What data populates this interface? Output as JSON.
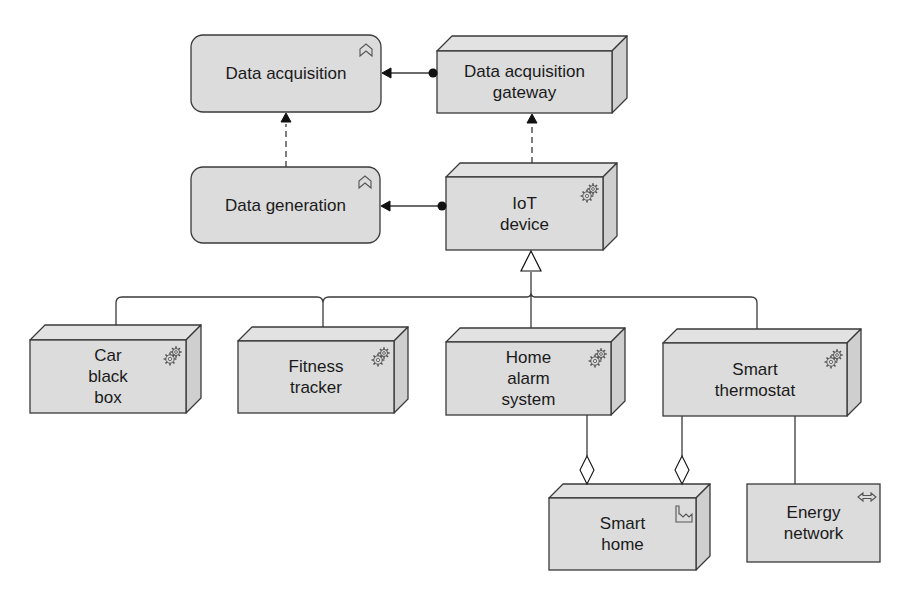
{
  "diagram": {
    "colors": {
      "fill": "#dcdcdc",
      "fill_side": "#cfcfcf",
      "fill_top": "#e2e2e2",
      "stroke": "#3a3a3a",
      "text": "#1a1a1a",
      "background": "#ffffff"
    },
    "nodes": [
      {
        "id": "data_acquisition",
        "label": "Data acquisition",
        "kind": "function",
        "icon": "function-chevron-icon",
        "x": 191,
        "y": 35,
        "w": 190,
        "h": 77
      },
      {
        "id": "data_acquisition_gateway",
        "label": "Data acquisition\ngateway",
        "kind": "node",
        "icon": "",
        "x": 437,
        "y": 51,
        "w": 175,
        "h": 62,
        "d": 15
      },
      {
        "id": "data_generation",
        "label": "Data generation",
        "kind": "function",
        "icon": "function-chevron-icon",
        "x": 191,
        "y": 167,
        "w": 189,
        "h": 76
      },
      {
        "id": "iot_device",
        "label": "IoT\ndevice",
        "kind": "node",
        "icon": "gears-icon",
        "x": 446,
        "y": 177,
        "w": 157,
        "h": 73,
        "d": 14
      },
      {
        "id": "car_black_box",
        "label": "Car\nblack\nbox",
        "kind": "node",
        "icon": "gears-icon",
        "x": 30,
        "y": 340,
        "w": 156,
        "h": 73,
        "d": 15
      },
      {
        "id": "fitness_tracker",
        "label": "Fitness\ntracker",
        "kind": "node",
        "icon": "gears-icon",
        "x": 238,
        "y": 341,
        "w": 156,
        "h": 72,
        "d": 14
      },
      {
        "id": "home_alarm_system",
        "label": "Home\nalarm\nsystem",
        "kind": "node",
        "icon": "gears-icon",
        "x": 446,
        "y": 342,
        "w": 165,
        "h": 73,
        "d": 14
      },
      {
        "id": "smart_thermostat",
        "label": "Smart\nthermostat",
        "kind": "node",
        "icon": "gears-icon",
        "x": 663,
        "y": 343,
        "w": 184,
        "h": 73,
        "d": 14
      },
      {
        "id": "smart_home",
        "label": "Smart\nhome",
        "kind": "facility",
        "icon": "factory-icon",
        "x": 549,
        "y": 498,
        "w": 147,
        "h": 72,
        "d": 14
      },
      {
        "id": "energy_network",
        "label": "Energy\nnetwork",
        "kind": "network",
        "icon": "bidirectional-arrow-icon",
        "x": 747,
        "y": 484,
        "w": 133,
        "h": 78
      }
    ],
    "relationships": [
      {
        "type": "assignment",
        "from": "data_acquisition_gateway",
        "to": "data_acquisition"
      },
      {
        "type": "assignment",
        "from": "iot_device",
        "to": "data_generation"
      },
      {
        "type": "realization",
        "from": "data_generation",
        "to": "data_acquisition"
      },
      {
        "type": "realization",
        "from": "iot_device",
        "to": "data_acquisition_gateway"
      },
      {
        "type": "specialization",
        "from": "car_black_box",
        "to": "iot_device"
      },
      {
        "type": "specialization",
        "from": "fitness_tracker",
        "to": "iot_device"
      },
      {
        "type": "specialization",
        "from": "home_alarm_system",
        "to": "iot_device"
      },
      {
        "type": "specialization",
        "from": "smart_thermostat",
        "to": "iot_device"
      },
      {
        "type": "aggregation",
        "from": "smart_home",
        "to": "home_alarm_system"
      },
      {
        "type": "aggregation",
        "from": "smart_home",
        "to": "smart_thermostat"
      },
      {
        "type": "association",
        "from": "smart_thermostat",
        "to": "energy_network"
      }
    ]
  }
}
